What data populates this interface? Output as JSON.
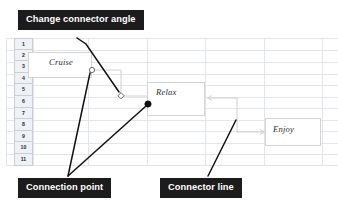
{
  "canvas": {
    "width": 338,
    "height": 210,
    "background": "#ffffff"
  },
  "spreadsheet": {
    "row_headers": [
      "1",
      "2",
      "3",
      "4",
      "5",
      "6",
      "7",
      "8",
      "9",
      "10",
      "11"
    ],
    "gridline_color": "#e2e6ea",
    "header_fill": "#eef1f5",
    "header_text_color": "#2b2b2b"
  },
  "shapes": [
    {
      "id": "cruise",
      "label": "Cruise",
      "border": "#d4d4d4",
      "fill": "#ffffff"
    },
    {
      "id": "relax",
      "label": "Relax",
      "border": "#d4d4d4",
      "fill": "#ffffff"
    },
    {
      "id": "enjoy",
      "label": "Enjoy",
      "border": "#d4d4d4",
      "fill": "#ffffff"
    }
  ],
  "connectors": [
    {
      "id": "cruise-to-relax",
      "from": "cruise",
      "to": "relax",
      "style": "elbow",
      "color": "#d0d0d0",
      "endpoint_handle": "circle-open",
      "midpoint_handle": "diamond-open"
    },
    {
      "id": "relax-to-enjoy",
      "from": "relax",
      "to": "enjoy",
      "style": "elbow",
      "color": "#d0d0d0",
      "arrowheads": true
    }
  ],
  "handles": [
    {
      "id": "connection-point-cruise",
      "type": "circle-open",
      "fill": "#ffffff",
      "stroke": "#555555"
    },
    {
      "id": "angle-handle",
      "type": "diamond-open",
      "fill": "#ffffff",
      "stroke": "#555555"
    },
    {
      "id": "connection-point-relax",
      "type": "circle-filled",
      "fill": "#111111",
      "stroke": "#111111"
    }
  ],
  "callouts": [
    {
      "id": "angle",
      "label": "Change connector angle",
      "background": "#1c1c1c",
      "color": "#ffffff"
    },
    {
      "id": "point",
      "label": "Connection point",
      "background": "#1c1c1c",
      "color": "#ffffff"
    },
    {
      "id": "line",
      "label": "Connector line",
      "background": "#1c1c1c",
      "color": "#ffffff"
    }
  ],
  "leader_lines": {
    "color": "#111111",
    "count": 4
  }
}
